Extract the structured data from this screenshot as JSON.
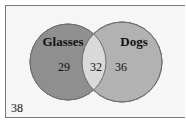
{
  "diagram": {
    "type": "venn",
    "sets": [
      {
        "name": "Glasses",
        "only_count": "29",
        "color": "#8f8f8f"
      },
      {
        "name": "Dogs",
        "only_count": "36",
        "color": "#b2b2b2"
      }
    ],
    "intersection": {
      "count": "32",
      "color": "#d9d9d9"
    },
    "outside": {
      "count": "38"
    },
    "background_color": "#f6f6f6"
  }
}
